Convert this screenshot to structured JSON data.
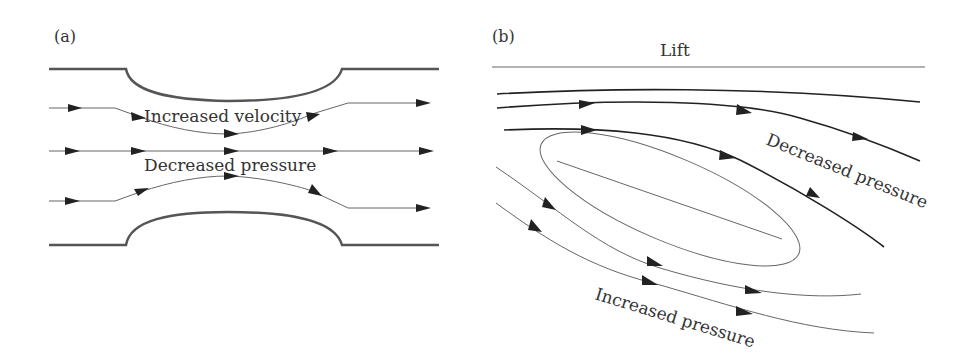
{
  "figure": {
    "panel_a": {
      "label": "(a)",
      "annotations": {
        "top": "Increased velocity",
        "middle": "Decreased pressure"
      }
    },
    "panel_b": {
      "label": "(b)",
      "annotations": {
        "lift": "Lift",
        "upper": "Decreased pressure",
        "lower": "Increased pressure"
      }
    },
    "colors": {
      "ink": "#222222",
      "wall": "#555555",
      "thin": "#666666"
    }
  }
}
